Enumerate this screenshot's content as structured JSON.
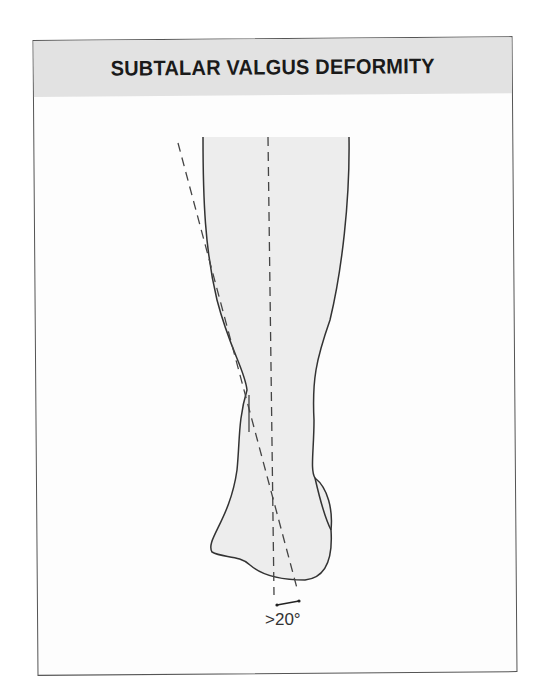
{
  "figure": {
    "title": "SUBTALAR VALGUS DEFORMITY",
    "angle_label": ">20°",
    "colors": {
      "header_bg": "#e2e2e2",
      "leg_fill": "#ededed",
      "outline": "#333333",
      "border": "#555555"
    },
    "elements": [
      {
        "name": "leg-outline",
        "description": "posterior view of lower leg and heel"
      },
      {
        "name": "vertical-reference-line",
        "style": "dashed"
      },
      {
        "name": "calcaneal-axis-line",
        "style": "dashed"
      },
      {
        "name": "angle-marker",
        "value": ">20°"
      }
    ]
  }
}
